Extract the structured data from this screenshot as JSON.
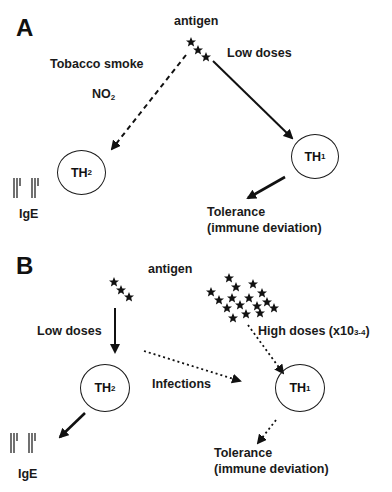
{
  "panels": [
    {
      "id": "A",
      "label": "A",
      "antigen_label": "antigen",
      "left_condition_1": "Tobacco smoke",
      "left_condition_2": "NO",
      "left_condition_2_sub": "2",
      "right_condition": "Low doses",
      "th2": {
        "base": "TH",
        "sub": "2"
      },
      "th1": {
        "base": "TH",
        "sub": "1"
      },
      "ige_label": "IgE",
      "tolerance_line1": "Tolerance",
      "tolerance_line2": "(immune deviation)"
    },
    {
      "id": "B",
      "label": "B",
      "antigen_label": "antigen",
      "left_condition": "Low doses",
      "middle_condition": "Infections",
      "right_condition": "High doses (x10",
      "right_condition_sup": "3-4",
      "right_condition_end": ")",
      "th2": {
        "base": "TH",
        "sub": "2"
      },
      "th1": {
        "base": "TH",
        "sub": "1"
      },
      "ige_label": "IgE",
      "tolerance_line1": "Tolerance",
      "tolerance_line2": "(immune deviation)"
    }
  ]
}
